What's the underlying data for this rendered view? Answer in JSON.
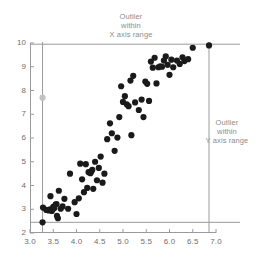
{
  "chart_data": {
    "type": "scatter",
    "title": "",
    "xlabel": "",
    "ylabel": "",
    "xlim": [
      3.0,
      7.0
    ],
    "ylim": [
      2,
      10
    ],
    "xticks": [
      "3.0",
      "3.5",
      "4.0",
      "4.5",
      "5.0",
      "5.5",
      "6.0",
      "6.5",
      "7.0"
    ],
    "xtick_values": [
      3.0,
      3.5,
      4.0,
      4.5,
      5.0,
      5.5,
      6.0,
      6.5,
      7.0
    ],
    "yticks": [
      "2",
      "3",
      "4",
      "5",
      "6",
      "7",
      "8",
      "9",
      "10"
    ],
    "ytick_values": [
      2,
      3,
      4,
      5,
      6,
      7,
      8,
      9,
      10
    ],
    "grid": false,
    "legend": "none",
    "marker_color": "#1a1a1a",
    "marker_size": 3.1,
    "reference_line_color": "#9a9a9a",
    "faint_marker_color": "#c2c2c2",
    "points": [
      [
        3.27,
        2.45
      ],
      [
        3.28,
        3.07
      ],
      [
        3.35,
        2.97
      ],
      [
        3.4,
        2.95
      ],
      [
        3.43,
        3.0
      ],
      [
        3.44,
        3.55
      ],
      [
        3.47,
        2.93
      ],
      [
        3.5,
        3.1
      ],
      [
        3.52,
        3.04
      ],
      [
        3.55,
        3.2
      ],
      [
        3.57,
        3.22
      ],
      [
        3.58,
        2.72
      ],
      [
        3.6,
        2.62
      ],
      [
        3.62,
        3.78
      ],
      [
        3.66,
        3.02
      ],
      [
        3.7,
        3.12
      ],
      [
        3.74,
        3.44
      ],
      [
        3.82,
        3.02
      ],
      [
        3.86,
        4.5
      ],
      [
        3.96,
        3.3
      ],
      [
        4.0,
        2.8
      ],
      [
        4.05,
        3.46
      ],
      [
        4.08,
        4.92
      ],
      [
        4.12,
        4.26
      ],
      [
        4.16,
        3.72
      ],
      [
        4.2,
        4.9
      ],
      [
        4.23,
        3.9
      ],
      [
        4.26,
        4.56
      ],
      [
        4.3,
        4.52
      ],
      [
        4.32,
        4.6
      ],
      [
        4.34,
        4.66
      ],
      [
        4.36,
        3.86
      ],
      [
        4.4,
        5.0
      ],
      [
        4.44,
        4.22
      ],
      [
        4.48,
        4.74
      ],
      [
        4.52,
        5.22
      ],
      [
        4.56,
        4.12
      ],
      [
        4.6,
        4.5
      ],
      [
        4.66,
        5.95
      ],
      [
        4.72,
        6.62
      ],
      [
        4.76,
        6.2
      ],
      [
        4.82,
        5.46
      ],
      [
        4.88,
        6.02
      ],
      [
        4.92,
        6.88
      ],
      [
        4.96,
        8.18
      ],
      [
        5.0,
        7.52
      ],
      [
        5.04,
        7.76
      ],
      [
        5.08,
        7.42
      ],
      [
        5.12,
        7.34
      ],
      [
        5.16,
        8.42
      ],
      [
        5.18,
        6.12
      ],
      [
        5.22,
        8.62
      ],
      [
        5.26,
        7.5
      ],
      [
        5.34,
        7.18
      ],
      [
        5.4,
        7.62
      ],
      [
        5.44,
        6.88
      ],
      [
        5.48,
        8.38
      ],
      [
        5.52,
        8.28
      ],
      [
        5.56,
        7.56
      ],
      [
        5.6,
        9.22
      ],
      [
        5.64,
        8.96
      ],
      [
        5.68,
        9.38
      ],
      [
        5.72,
        8.3
      ],
      [
        5.76,
        8.98
      ],
      [
        5.8,
        9.02
      ],
      [
        5.84,
        9.0
      ],
      [
        5.88,
        9.26
      ],
      [
        5.92,
        9.44
      ],
      [
        5.96,
        9.08
      ],
      [
        6.0,
        8.66
      ],
      [
        6.04,
        9.3
      ],
      [
        6.08,
        8.98
      ],
      [
        6.16,
        9.26
      ],
      [
        6.22,
        9.12
      ],
      [
        6.28,
        9.4
      ],
      [
        6.32,
        9.24
      ],
      [
        6.4,
        9.32
      ],
      [
        6.5,
        9.8
      ]
    ],
    "faint_points": [
      [
        3.27,
        7.7
      ]
    ],
    "outlier_points": [
      [
        6.85,
        9.9
      ]
    ],
    "reference_lines": [
      {
        "orientation": "vertical",
        "value": 3.27,
        "label": "x-outlier-boundary"
      },
      {
        "orientation": "vertical",
        "value": 6.85,
        "label": "y-outlier-boundary"
      },
      {
        "orientation": "horizontal",
        "value": 9.95,
        "label": "upper-boundary"
      },
      {
        "orientation": "horizontal",
        "value": 2.45,
        "label": "lower-boundary"
      }
    ],
    "annotations": [
      {
        "id": "x-outlier",
        "lines": [
          "Outlier",
          "within",
          "X axis range"
        ]
      },
      {
        "id": "y-outlier",
        "lines": [
          "Outlier",
          "within",
          "Y axis range"
        ]
      }
    ]
  }
}
